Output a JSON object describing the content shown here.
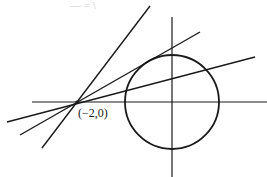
{
  "figure": {
    "caption_fragment": "— = \\",
    "point_label": "(−2,0)",
    "stroke_color": "#1a1a1a",
    "background": "#ffffff"
  },
  "geometry": {
    "origin_px": [
      172,
      102
    ],
    "circle": {
      "cx": 172,
      "cy": 102,
      "r": 47
    },
    "external_point_px": [
      77,
      102
    ],
    "x_axis": {
      "x1": 32,
      "y1": 102,
      "x2": 267,
      "y2": 102
    },
    "y_axis": {
      "x1": 172,
      "y1": 17,
      "x2": 172,
      "y2": 177
    },
    "lines": [
      {
        "name": "steep-line",
        "x1": 42,
        "y1": 148,
        "x2": 150,
        "y2": 6
      },
      {
        "name": "upper-tangent-line",
        "x1": 20,
        "y1": 135,
        "x2": 200,
        "y2": 32
      },
      {
        "name": "secant-line",
        "x1": 7,
        "y1": 122,
        "x2": 255,
        "y2": 57
      }
    ]
  }
}
